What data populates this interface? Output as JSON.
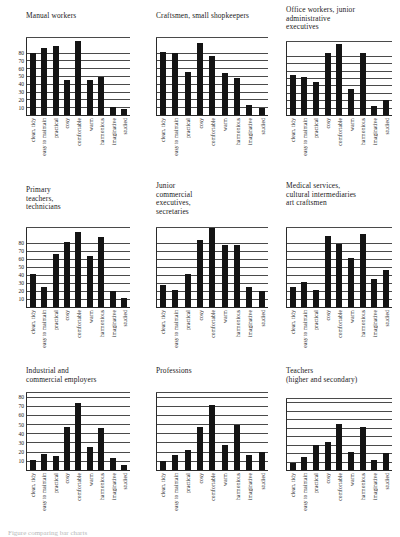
{
  "figure": {
    "caption": "Figure comparing bar charts"
  },
  "chart_data": [
    {
      "type": "bar",
      "title": "Manual workers",
      "categories": [
        "clean, tidy",
        "easy to maintain",
        "practical",
        "cosy",
        "comfortable",
        "warm",
        "harmonious",
        "imaginative",
        "studied"
      ],
      "values": [
        80,
        87,
        90,
        45,
        96,
        45,
        50,
        10,
        8
      ],
      "yticks": [
        10,
        20,
        30,
        40,
        50,
        60,
        70,
        80
      ],
      "ylim": [
        0,
        100
      ],
      "xlabel": "",
      "ylabel": "",
      "grid": true,
      "legend": "none"
    },
    {
      "type": "bar",
      "title": "Craftsmen, small shopkeepers",
      "categories": [
        "clean, tidy",
        "easy to maintain",
        "practical",
        "cosy",
        "comfortable",
        "warm",
        "harmonious",
        "imaginative",
        "studied"
      ],
      "values": [
        82,
        80,
        56,
        93,
        77,
        55,
        48,
        13,
        9
      ],
      "yticks": [
        10,
        20,
        30,
        40,
        50,
        60,
        70,
        80
      ],
      "ylim": [
        0,
        100
      ],
      "xlabel": "",
      "ylabel": "",
      "grid": true,
      "legend": "none"
    },
    {
      "type": "bar",
      "title": "Office workers, junior\nadministrative\nexecutives",
      "categories": [
        "clean, tidy",
        "easy to maintain",
        "practical",
        "cosy",
        "comfortable",
        "warm",
        "harmonious",
        "imaginative",
        "studied"
      ],
      "values": [
        55,
        52,
        45,
        85,
        97,
        35,
        85,
        12,
        20
      ],
      "yticks": [
        10,
        20,
        30,
        40,
        50,
        60,
        70,
        80
      ],
      "ylim": [
        0,
        100
      ],
      "xlabel": "",
      "ylabel": "",
      "grid": true,
      "legend": "none"
    },
    {
      "type": "bar",
      "title": "Primary\nteachers,\ntechnicians",
      "categories": [
        "clean, tidy",
        "easy to maintain",
        "practical",
        "cosy",
        "comfortable",
        "warm",
        "harmonious",
        "imaginative",
        "studied"
      ],
      "values": [
        42,
        25,
        67,
        82,
        95,
        64,
        88,
        20,
        12
      ],
      "yticks": [
        10,
        20,
        30,
        40,
        50,
        60,
        70,
        80
      ],
      "ylim": [
        0,
        100
      ],
      "xlabel": "",
      "ylabel": "",
      "grid": true,
      "legend": "none"
    },
    {
      "type": "bar",
      "title": "Junior\ncommercial\nexecutives,\nsecretaries",
      "categories": [
        "clean, tidy",
        "easy to maintain",
        "practical",
        "cosy",
        "comfortable",
        "warm",
        "harmonious",
        "imaginative",
        "studied"
      ],
      "values": [
        28,
        22,
        42,
        85,
        100,
        78,
        78,
        25,
        20
      ],
      "yticks": [
        10,
        20,
        30,
        40,
        50,
        60,
        70,
        80
      ],
      "ylim": [
        0,
        100
      ],
      "xlabel": "",
      "ylabel": "",
      "grid": true,
      "legend": "none"
    },
    {
      "type": "bar",
      "title": "Medical services,\ncultural intermediaries\nart craftsmen",
      "categories": [
        "clean, tidy",
        "easy to maintain",
        "practical",
        "cosy",
        "comfortable",
        "warm",
        "harmonious",
        "imaginative",
        "studied"
      ],
      "values": [
        25,
        32,
        22,
        90,
        80,
        62,
        92,
        35,
        47
      ],
      "yticks": [
        10,
        20,
        30,
        40,
        50,
        60,
        70,
        80
      ],
      "ylim": [
        0,
        100
      ],
      "xlabel": "",
      "ylabel": "",
      "grid": true,
      "legend": "none"
    },
    {
      "type": "bar",
      "title": "Industrial and\ncommercial employers",
      "categories": [
        "clean, tidy",
        "easy to maintain",
        "practical",
        "cosy",
        "comfortable",
        "warm",
        "harmonious",
        "imaginative",
        "studied"
      ],
      "values": [
        11,
        18,
        15,
        48,
        74,
        25,
        46,
        13,
        5
      ],
      "yticks": [
        10,
        20,
        30,
        40,
        50,
        60,
        70,
        80
      ],
      "ylim": [
        0,
        85
      ],
      "xlabel": "",
      "ylabel": "",
      "grid": true,
      "legend": "none"
    },
    {
      "type": "bar",
      "title": "Professions",
      "categories": [
        "clean, tidy",
        "easy to maintain",
        "practical",
        "cosy",
        "comfortable",
        "warm",
        "harmonious",
        "imaginative",
        "studied"
      ],
      "values": [
        10,
        17,
        22,
        48,
        72,
        28,
        50,
        17,
        20
      ],
      "yticks": [
        10,
        20,
        30,
        40,
        50,
        60,
        70,
        80
      ],
      "ylim": [
        0,
        85
      ],
      "xlabel": "",
      "ylabel": "",
      "grid": true,
      "legend": "none"
    },
    {
      "type": "bar",
      "title": "Teachers\n(higher and secondary)",
      "categories": [
        "clean, tidy",
        "easy to maintain",
        "practical",
        "cosy",
        "comfortable",
        "warm",
        "harmonious",
        "imaginative",
        "studied"
      ],
      "values": [
        8,
        16,
        30,
        34,
        55,
        22,
        52,
        12,
        20
      ],
      "yticks": [
        10,
        20,
        30,
        40,
        50,
        60,
        70,
        80
      ],
      "ylim": [
        0,
        85
      ],
      "xlabel": "",
      "ylabel": "",
      "grid": true,
      "legend": "none"
    }
  ]
}
